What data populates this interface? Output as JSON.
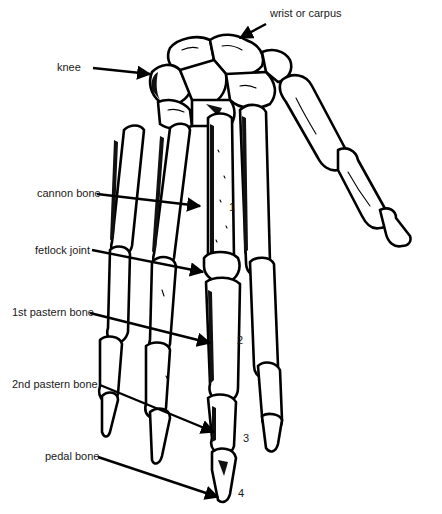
{
  "diagram": {
    "labels": [
      {
        "id": "wrist",
        "text": "wrist or carpus"
      },
      {
        "id": "knee",
        "text": "knee"
      },
      {
        "id": "cannon",
        "text": "cannon bone"
      },
      {
        "id": "fetlock",
        "text": "fetlock joint"
      },
      {
        "id": "pastern1",
        "text": "1st pastern bone"
      },
      {
        "id": "pastern2",
        "text": "2nd pastern bone"
      },
      {
        "id": "pedal",
        "text": "pedal bone"
      }
    ],
    "numbers": [
      {
        "id": "n1",
        "text": "1"
      },
      {
        "id": "n2",
        "text": "2"
      },
      {
        "id": "n3",
        "text": "3"
      },
      {
        "id": "n4",
        "text": "4"
      }
    ],
    "colors": {
      "ink": "#000000",
      "background": "#ffffff"
    }
  }
}
